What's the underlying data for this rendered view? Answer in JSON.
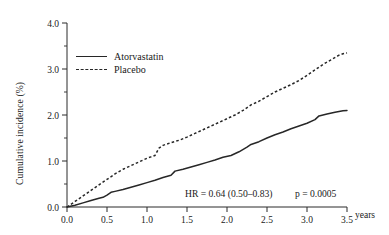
{
  "chart_data": {
    "type": "line",
    "title": "",
    "xlabel": "years",
    "ylabel": "Cumulative incidence (%)",
    "xlim": [
      0.0,
      3.5
    ],
    "ylim": [
      0.0,
      4.0
    ],
    "xticks": [
      "0.0",
      "0.5",
      "1.0",
      "1.5",
      "2.0",
      "2.5",
      "3.0",
      "3.5"
    ],
    "xtick_values": [
      0.0,
      0.5,
      1.0,
      1.5,
      2.0,
      2.5,
      3.0,
      3.5
    ],
    "yticks": [
      "0.0",
      "1.0",
      "2.0",
      "3.0",
      "4.0"
    ],
    "ytick_values": [
      0.0,
      1.0,
      2.0,
      3.0,
      4.0
    ],
    "yticks_minor": [
      0.5,
      1.5,
      2.5,
      3.5
    ],
    "grid": false,
    "legend_position": "upper-left-inside",
    "series": [
      {
        "name": "Atorvastatin",
        "style": "solid",
        "color": "#272727",
        "x": [
          0.0,
          0.1,
          0.2,
          0.3,
          0.4,
          0.45,
          0.5,
          0.55,
          0.6,
          0.7,
          0.8,
          0.9,
          1.0,
          1.1,
          1.2,
          1.3,
          1.35,
          1.45,
          1.55,
          1.65,
          1.75,
          1.85,
          1.95,
          2.05,
          2.15,
          2.25,
          2.3,
          2.4,
          2.5,
          2.6,
          2.7,
          2.8,
          2.9,
          3.0,
          3.1,
          3.15,
          3.25,
          3.35,
          3.45,
          3.5
        ],
        "values": [
          0.0,
          0.04,
          0.09,
          0.14,
          0.19,
          0.21,
          0.26,
          0.32,
          0.34,
          0.38,
          0.43,
          0.48,
          0.53,
          0.58,
          0.64,
          0.69,
          0.78,
          0.82,
          0.87,
          0.92,
          0.97,
          1.02,
          1.08,
          1.12,
          1.2,
          1.3,
          1.36,
          1.42,
          1.5,
          1.57,
          1.63,
          1.7,
          1.76,
          1.82,
          1.9,
          1.98,
          2.02,
          2.06,
          2.09,
          2.1
        ]
      },
      {
        "name": "Placebo",
        "style": "dashed",
        "color": "#272727",
        "x": [
          0.0,
          0.1,
          0.2,
          0.3,
          0.4,
          0.5,
          0.6,
          0.7,
          0.8,
          0.9,
          1.0,
          1.05,
          1.1,
          1.15,
          1.2,
          1.3,
          1.4,
          1.5,
          1.6,
          1.7,
          1.8,
          1.9,
          2.0,
          2.1,
          2.2,
          2.3,
          2.4,
          2.5,
          2.6,
          2.7,
          2.8,
          2.9,
          3.0,
          3.1,
          3.2,
          3.3,
          3.4,
          3.45,
          3.5
        ],
        "values": [
          0.0,
          0.12,
          0.24,
          0.36,
          0.48,
          0.6,
          0.72,
          0.82,
          0.9,
          0.98,
          1.06,
          1.09,
          1.12,
          1.28,
          1.34,
          1.4,
          1.45,
          1.52,
          1.6,
          1.68,
          1.76,
          1.84,
          1.92,
          2.0,
          2.1,
          2.22,
          2.3,
          2.4,
          2.5,
          2.58,
          2.66,
          2.75,
          2.86,
          2.98,
          3.1,
          3.2,
          3.3,
          3.33,
          3.35
        ]
      }
    ],
    "annotations": [
      {
        "id": "hazard-ratio",
        "text": "HR = 0.64 (0.50–0.83)"
      },
      {
        "id": "p-value",
        "text": "p = 0.0005"
      }
    ]
  },
  "legend": {
    "entries": [
      {
        "label": "Atorvastatin",
        "style": "solid"
      },
      {
        "label": "Placebo",
        "style": "dashed"
      }
    ]
  },
  "axis": {
    "x_unit_label": "years"
  }
}
